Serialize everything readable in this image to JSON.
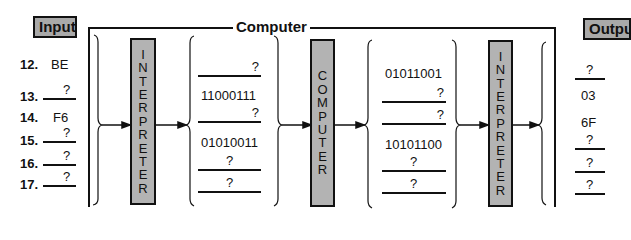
{
  "labels": {
    "input": "Input",
    "output": "Output",
    "computer": "Computer"
  },
  "blocks": {
    "interpreter_left": [
      "I",
      "N",
      "T",
      "E",
      "R",
      "P",
      "R",
      "E",
      "T",
      "E",
      "R"
    ],
    "computer": [
      "C",
      "O",
      "M",
      "P",
      "U",
      "T",
      "E",
      "R"
    ],
    "interpreter_right": [
      "I",
      "N",
      "T",
      "E",
      "R",
      "P",
      "R",
      "E",
      "T",
      "E",
      "R"
    ]
  },
  "input_rows": [
    {
      "num": "12.",
      "value": "BE",
      "blank": false
    },
    {
      "num": "13.",
      "value": "?",
      "blank": true
    },
    {
      "num": "14.",
      "value": "F6",
      "blank": false
    },
    {
      "num": "15.",
      "value": "?",
      "blank": true
    },
    {
      "num": "16.",
      "value": "?",
      "blank": true
    },
    {
      "num": "17.",
      "value": "?",
      "blank": true
    }
  ],
  "binary_in": [
    {
      "value": "?",
      "blank": true
    },
    {
      "value": "11000111",
      "blank": false
    },
    {
      "value": "?",
      "blank": true
    },
    {
      "value": "01010011",
      "blank": false
    },
    {
      "value": "?",
      "blank": true
    },
    {
      "value": "?",
      "blank": true
    }
  ],
  "binary_out": [
    {
      "value": "01011001",
      "blank": false
    },
    {
      "value": "?",
      "blank": true
    },
    {
      "value": "?",
      "blank": true
    },
    {
      "value": "10101100",
      "blank": false
    },
    {
      "value": "?",
      "blank": true
    },
    {
      "value": "?",
      "blank": true
    }
  ],
  "output_rows": [
    {
      "value": "?",
      "blank": true
    },
    {
      "value": "03",
      "blank": false
    },
    {
      "value": "6F",
      "blank": false
    },
    {
      "value": "?",
      "blank": true
    },
    {
      "value": "?",
      "blank": true
    },
    {
      "value": "?",
      "blank": true
    }
  ],
  "colors": {
    "box_fill": "#a9a9a9",
    "block_fill": "#b3b3b3",
    "ink": "#111111"
  }
}
